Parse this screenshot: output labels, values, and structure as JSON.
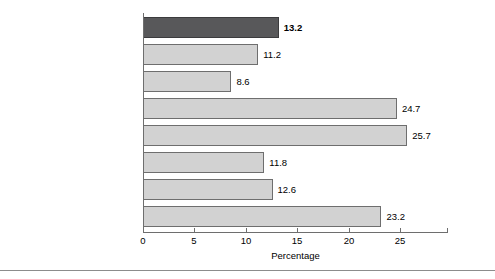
{
  "chart_data": {
    "type": "bar",
    "orientation": "horizontal",
    "title": "",
    "xlabel": "Percentage",
    "ylabel": "",
    "xlim": [
      0,
      29.6
    ],
    "xticks": [
      0,
      5,
      10,
      15,
      20,
      25
    ],
    "xtick_labels": [
      "0",
      "5",
      "10",
      "15",
      "20",
      "25"
    ],
    "grid": false,
    "legend": null,
    "categories": [
      "All races",
      "White",
      "White, non-Hispanic",
      "Black",
      "American Indian and\nAlaska Native",
      "Asian",
      "Native Hawaiian and\nOther Pacific Islander",
      "Hispanic Origin (any race)"
    ],
    "values": [
      13.2,
      11.2,
      8.6,
      24.7,
      25.7,
      11.8,
      12.6,
      23.2
    ],
    "value_labels": [
      "13.2",
      "11.2",
      "8.6",
      "24.7",
      "25.7",
      "11.8",
      "12.6",
      "23.2"
    ],
    "bars": [
      {
        "category": "All races",
        "value": 13.2,
        "label": "13.2",
        "highlight": true,
        "emphasis": "bold",
        "color": "#58585a"
      },
      {
        "category": "White",
        "value": 11.2,
        "label": "11.2",
        "highlight": false,
        "emphasis": "normal",
        "color": "#d2d2d2"
      },
      {
        "category": "White, non-Hispanic",
        "value": 8.6,
        "label": "8.6",
        "highlight": false,
        "emphasis": "normal",
        "color": "#d2d2d2"
      },
      {
        "category": "Black",
        "value": 24.7,
        "label": "24.7",
        "highlight": false,
        "emphasis": "normal",
        "color": "#d2d2d2"
      },
      {
        "category": "American Indian and\nAlaska Native",
        "value": 25.7,
        "label": "25.7",
        "highlight": false,
        "emphasis": "normal",
        "color": "#d2d2d2"
      },
      {
        "category": "Asian",
        "value": 11.8,
        "label": "11.8",
        "highlight": false,
        "emphasis": "normal",
        "color": "#d2d2d2"
      },
      {
        "category": "Native Hawaiian and\nOther Pacific Islander",
        "value": 12.6,
        "label": "12.6",
        "highlight": false,
        "emphasis": "normal",
        "color": "#d2d2d2"
      },
      {
        "category": "Hispanic Origin (any race)",
        "value": 23.2,
        "label": "23.2",
        "highlight": false,
        "emphasis": "normal",
        "color": "#d2d2d2"
      }
    ],
    "colors": {
      "highlight_bar": "#58585a",
      "bar": "#d2d2d2",
      "bar_outline": "#6e6e6e",
      "axis": "#6e6e6e",
      "text": "#000000",
      "rule": "#8c8c8c"
    }
  }
}
